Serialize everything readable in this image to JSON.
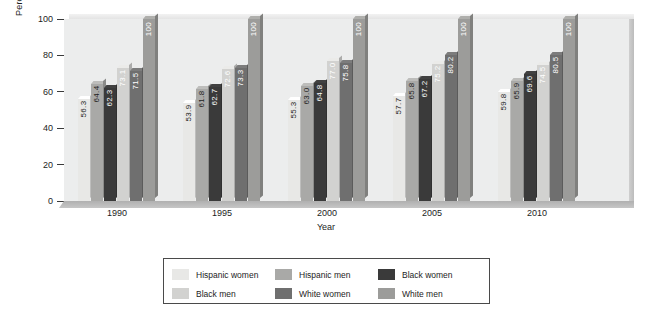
{
  "chart_data": {
    "type": "bar",
    "title": "",
    "subtitle": "",
    "xlabel": "Year",
    "ylabel": "Percentage",
    "categories": [
      "1990",
      "1995",
      "2000",
      "2005",
      "2010"
    ],
    "ylim": [
      0,
      100
    ],
    "yticks": [
      "0",
      "20",
      "40",
      "60",
      "80",
      "100"
    ],
    "grid": false,
    "legend_position": "bottom-outside",
    "series": [
      {
        "name": "Hispanic women",
        "color": "#e8e8e6",
        "label_color": "#1d1d1d",
        "values": [
          56.3,
          61.8,
          55.3,
          57.7,
          59.8
        ],
        "labels": [
          "56.3",
          "53.9",
          "55.3",
          "57.7",
          "59.8"
        ]
      },
      {
        "name": "Hispanic men",
        "color": "#a9a9a7",
        "label_color": "#1d1d1d",
        "values": [
          64.4,
          61.8,
          63.0,
          65.8,
          65.9
        ],
        "labels": [
          "64.4",
          "61.8",
          "63.0",
          "65.8",
          "65.9"
        ]
      },
      {
        "name": "Black women",
        "color": "#3a3a3a",
        "label_color": "#ffffff",
        "values": [
          62.3,
          62.7,
          64.8,
          67.2,
          69.6
        ],
        "labels": [
          "62.3",
          "62.7",
          "64.8",
          "67.2",
          "69.6"
        ]
      },
      {
        "name": "Black men",
        "color": "#d2d2d0",
        "label_color": "#ffffff",
        "values": [
          73.1,
          72.6,
          77.0,
          75.2,
          74.5
        ],
        "labels": [
          "73.1",
          "72.6",
          "77.0",
          "75.2",
          "74.5"
        ]
      },
      {
        "name": "White women",
        "color": "#6f6f6f",
        "label_color": "#ffffff",
        "values": [
          71.5,
          73.3,
          75.8,
          80.2,
          80.5
        ],
        "labels": [
          "71.5",
          "73.3",
          "75.8",
          "80.2",
          "80.5"
        ]
      },
      {
        "name": "White men",
        "color": "#9c9c9a",
        "label_color": "#ffffff",
        "values": [
          100,
          100,
          100,
          100,
          100
        ],
        "labels": [
          "100",
          "100",
          "100",
          "100",
          "100"
        ]
      }
    ]
  },
  "corrections": {
    "hispanic_women_1995": "53.9"
  }
}
